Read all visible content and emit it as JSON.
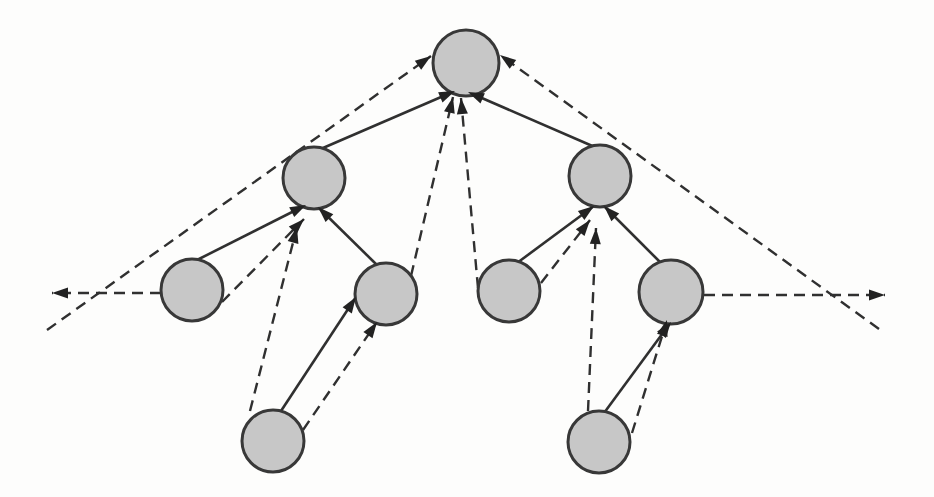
{
  "figure": {
    "canvas": {
      "width": 934,
      "height": 497,
      "background": "#fdfdfc"
    },
    "style": {
      "node_fill": "#c7c7c7",
      "node_stroke": "#383838",
      "node_stroke_width": 3,
      "line_color": "#303030",
      "solid_width": 2.6,
      "dashed_width": 2.4,
      "dash_pattern": "11 7",
      "arrow_color": "#222222",
      "arrow_length": 16,
      "arrow_half_width": 5.5
    },
    "nodes": [
      {
        "id": "root",
        "x": 466,
        "y": 63,
        "r": 33
      },
      {
        "id": "left-child",
        "x": 314,
        "y": 178,
        "r": 31
      },
      {
        "id": "right-child",
        "x": 600,
        "y": 176,
        "r": 31
      },
      {
        "id": "left-outer-grandchild",
        "x": 192,
        "y": 290,
        "r": 31
      },
      {
        "id": "left-inner-grandchild",
        "x": 386,
        "y": 294,
        "r": 31
      },
      {
        "id": "right-inner-grandchild",
        "x": 509,
        "y": 291,
        "r": 31
      },
      {
        "id": "right-outer-grandchild",
        "x": 671,
        "y": 292,
        "r": 32
      },
      {
        "id": "left-leaf",
        "x": 273,
        "y": 441,
        "r": 31
      },
      {
        "id": "right-leaf",
        "x": 599,
        "y": 442,
        "r": 31
      }
    ],
    "edges": [
      {
        "from": "left-child",
        "to": "root",
        "style": "solid",
        "x1": 316,
        "y1": 151,
        "x2": 455,
        "y2": 91
      },
      {
        "from": "right-child",
        "to": "root",
        "style": "solid",
        "x1": 597,
        "y1": 148,
        "x2": 468,
        "y2": 92
      },
      {
        "from": "left-outer-grandchild",
        "to": "left-child",
        "style": "solid",
        "x1": 197,
        "y1": 260,
        "x2": 306,
        "y2": 205
      },
      {
        "from": "left-inner-grandchild",
        "to": "left-child",
        "style": "solid",
        "x1": 378,
        "y1": 266,
        "x2": 318,
        "y2": 207
      },
      {
        "from": "right-inner-grandchild",
        "to": "right-child",
        "style": "solid",
        "x1": 517,
        "y1": 263,
        "x2": 594,
        "y2": 206
      },
      {
        "from": "right-outer-grandchild",
        "to": "right-child",
        "style": "solid",
        "x1": 662,
        "y1": 264,
        "x2": 604,
        "y2": 206
      },
      {
        "from": "left-leaf",
        "to": "left-inner-grandchild",
        "style": "solid",
        "x1": 281,
        "y1": 411,
        "x2": 356,
        "y2": 297
      },
      {
        "from": "right-leaf",
        "to": "right-outer-grandchild",
        "style": "solid",
        "x1": 604,
        "y1": 413,
        "x2": 671,
        "y2": 322
      },
      {
        "from": "left-outer-grandchild",
        "to": "left-child",
        "style": "dashed",
        "x1": 222,
        "y1": 302,
        "x2": 304,
        "y2": 219
      },
      {
        "from": "left-leaf",
        "to": "left-child",
        "style": "dashed",
        "x1": 250,
        "y1": 411,
        "x2": 297,
        "y2": 227
      },
      {
        "from": "left-leaf",
        "to": "left-inner-grandchild",
        "style": "dashed",
        "x1": 303,
        "y1": 430,
        "x2": 377,
        "y2": 322
      },
      {
        "from": "left-inner-grandchild",
        "to": "root",
        "style": "dashed",
        "x1": 411,
        "y1": 276,
        "x2": 453,
        "y2": 97
      },
      {
        "from": "right-inner-grandchild",
        "to": "root",
        "style": "dashed",
        "x1": 478,
        "y1": 288,
        "x2": 461,
        "y2": 98
      },
      {
        "from": "right-inner-grandchild",
        "to": "right-child",
        "style": "dashed",
        "x1": 541,
        "y1": 283,
        "x2": 590,
        "y2": 220
      },
      {
        "from": "right-leaf",
        "to": "right-child",
        "style": "dashed",
        "x1": 588,
        "y1": 411,
        "x2": 596,
        "y2": 228
      },
      {
        "from": "right-leaf",
        "to": "right-outer-grandchild",
        "style": "dashed",
        "x1": 632,
        "y1": 433,
        "x2": 667,
        "y2": 320
      },
      {
        "from": "left-outer-grandchild",
        "to": "left-neighbor",
        "style": "dashed",
        "x1": 161,
        "y1": 293,
        "x2": 52,
        "y2": 293
      },
      {
        "from": "right-outer-grandchild",
        "to": "right-neighbor",
        "style": "dashed",
        "x1": 704,
        "y1": 295,
        "x2": 885,
        "y2": 295
      },
      {
        "from": "left-neighbor",
        "to": "root",
        "style": "dashed",
        "x1": 47,
        "y1": 330,
        "x2": 431,
        "y2": 56
      },
      {
        "from": "right-neighbor",
        "to": "root",
        "style": "dashed",
        "x1": 879,
        "y1": 329,
        "x2": 500,
        "y2": 55
      }
    ]
  }
}
